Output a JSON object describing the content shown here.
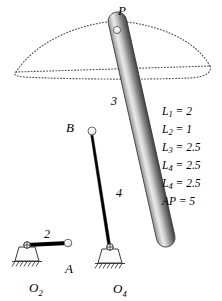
{
  "figure": {
    "background_color": "#ffffff",
    "line_color": "#000000",
    "link_fill_light": "#f2f2f2",
    "link_fill_mid": "#9a9a9a",
    "link_fill_dark": "#4a4a4a",
    "coupler_curve_color": "#555555"
  },
  "points": {
    "P": {
      "label": "P",
      "x": 117,
      "y": 21
    },
    "B": {
      "label": "B",
      "x": 92,
      "y": 131
    },
    "A": {
      "label": "A",
      "x": 68,
      "y": 243
    },
    "O2": {
      "label": "O",
      "sub": "2",
      "x": 27,
      "y": 245
    },
    "O4": {
      "label": "O",
      "sub": "4",
      "x": 110,
      "y": 247
    }
  },
  "link_labels": {
    "crank": "2",
    "coupler": "3",
    "rocker": "4"
  },
  "parameters": [
    {
      "name": "L",
      "sub": "1",
      "value": "2"
    },
    {
      "name": "L",
      "sub": "2",
      "value": "1"
    },
    {
      "name": "L",
      "sub": "3",
      "value": "2.5"
    },
    {
      "name": "L",
      "sub": "4",
      "value": "2.5"
    },
    {
      "name": "L",
      "sub": "4",
      "value": "2.5"
    },
    {
      "name": "AP",
      "sub": "",
      "value": "5"
    }
  ],
  "parameter_lines": [
    "L1 = 2",
    "L2 = 1",
    "L3 = 2.5",
    "L4 = 2.5",
    "L4 = 2.5",
    "AP = 5"
  ]
}
